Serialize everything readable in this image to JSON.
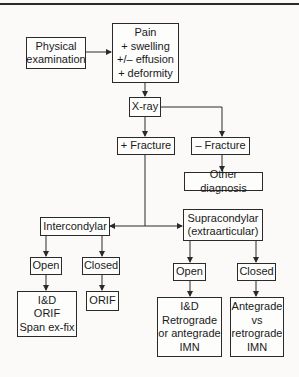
{
  "diagram": {
    "nodes": {
      "physical_exam": "Physical\nexamination",
      "symptoms": "Pain\n+ swelling\n+/– effusion\n+ deformity",
      "xray": "X-ray",
      "pos_fracture": "+ Fracture",
      "neg_fracture": "– Fracture",
      "other_diagnosis": "Other diagnosis",
      "intercondylar": "Intercondylar",
      "supracondylar": "Supracondylar\n(extraarticular)",
      "inter_open": "Open",
      "inter_closed": "Closed",
      "inter_open_tx": "I&D\nORIF\nSpan ex-fix",
      "inter_closed_tx": "ORIF",
      "supra_open": "Open",
      "supra_closed": "Closed",
      "supra_open_tx": "I&D\nRetrograde\nor antegrade\nIMN",
      "supra_closed_tx": "Antegrade\nvs\nretrograde\nIMN"
    },
    "edges": [
      [
        "physical_exam",
        "symptoms"
      ],
      [
        "symptoms",
        "xray"
      ],
      [
        "xray",
        "pos_fracture"
      ],
      [
        "xray",
        "neg_fracture"
      ],
      [
        "neg_fracture",
        "other_diagnosis"
      ],
      [
        "pos_fracture",
        "intercondylar"
      ],
      [
        "pos_fracture",
        "supracondylar"
      ],
      [
        "intercondylar",
        "inter_open"
      ],
      [
        "intercondylar",
        "inter_closed"
      ],
      [
        "inter_open",
        "inter_open_tx"
      ],
      [
        "inter_closed",
        "inter_closed_tx"
      ],
      [
        "supracondylar",
        "supra_open"
      ],
      [
        "supracondylar",
        "supra_closed"
      ],
      [
        "supra_open",
        "supra_open_tx"
      ],
      [
        "supra_closed",
        "supra_closed_tx"
      ]
    ]
  }
}
